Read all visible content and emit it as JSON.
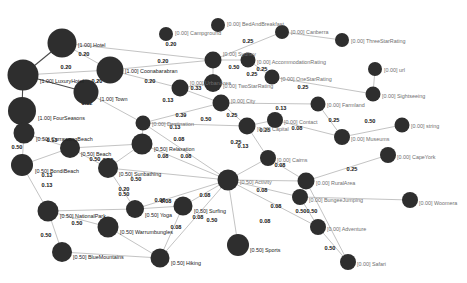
{
  "figure": {
    "type": "network-graph",
    "title": "",
    "background_color": "#ffffff",
    "node_color": "#2e2e2e",
    "edge_color": "#9a9a9a",
    "edge_color_strong": "#4a4a4a",
    "label_color_dim": "#6f6f6f",
    "label_color_strong": "#202020",
    "edge_label_color": "#141414"
  },
  "chart_data": {
    "type": "scatter",
    "title": "",
    "xlabel": "",
    "ylabel": "",
    "nodes": [
      {
        "id": "Hotel",
        "label": "[1.00] Hotel",
        "score": 1.0,
        "x": 62,
        "y": 43,
        "r": 14.5,
        "label_dx": 16,
        "label_dy": 3,
        "strong": true
      },
      {
        "id": "LuxuryHotel",
        "label": "[1.00] LuxuryHotel",
        "score": 1.0,
        "x": 23,
        "y": 75,
        "r": 15.5,
        "label_dx": 17,
        "label_dy": 7,
        "strong": true
      },
      {
        "id": "FourSeasons",
        "label": "[1.00] FourSeasons",
        "score": 1.0,
        "x": 22,
        "y": 111,
        "r": 14.0,
        "label_dx": 16,
        "label_dy": 8,
        "strong": true
      },
      {
        "id": "Town",
        "label": "[1.00] Town",
        "score": 1.0,
        "x": 86,
        "y": 92,
        "r": 12.5,
        "label_dx": 14,
        "label_dy": 8,
        "strong": true
      },
      {
        "id": "Coonabarabran",
        "label": "[1.00] Coonabarabran",
        "score": 1.0,
        "x": 110,
        "y": 70,
        "r": 13.5,
        "label_dx": 15,
        "label_dy": 2,
        "strong": true
      },
      {
        "id": "CurrawongBeach",
        "label": "[0.50] CurrawongBeach",
        "score": 0.5,
        "x": 24,
        "y": 133,
        "r": 10.5,
        "label_dx": 12,
        "label_dy": 7,
        "strong": true
      },
      {
        "id": "BondiBeach",
        "label": "[0.50] BondiBeach",
        "score": 0.5,
        "x": 22,
        "y": 165,
        "r": 11.0,
        "label_dx": 13,
        "label_dy": 7,
        "strong": true
      },
      {
        "id": "Beach",
        "label": "[0.50] Beach",
        "score": 0.5,
        "x": 70,
        "y": 148,
        "r": 10.0,
        "label_dx": 11,
        "label_dy": 7,
        "strong": true
      },
      {
        "id": "Sunbathing",
        "label": "[0.50] Sunbathing",
        "score": 0.5,
        "x": 108,
        "y": 168,
        "r": 10.0,
        "label_dx": 11,
        "label_dy": 7,
        "strong": true
      },
      {
        "id": "NationalPark",
        "label": "[0.50] NationalPark",
        "score": 0.5,
        "x": 48,
        "y": 211,
        "r": 10.5,
        "label_dx": 12,
        "label_dy": 6,
        "strong": true
      },
      {
        "id": "BlueMountains",
        "label": "[0.50] BlueMountains",
        "score": 0.5,
        "x": 62,
        "y": 252,
        "r": 10.0,
        "label_dx": 11,
        "label_dy": 6,
        "strong": true
      },
      {
        "id": "Warrumbungles",
        "label": "[0.50] Warrumbungles",
        "score": 0.5,
        "x": 108,
        "y": 227,
        "r": 10.5,
        "label_dx": 12,
        "label_dy": 6,
        "strong": true
      },
      {
        "id": "Yoga",
        "label": "[0.50] Yoga",
        "score": 0.5,
        "x": 135,
        "y": 209,
        "r": 9.0,
        "label_dx": 10,
        "label_dy": 7,
        "strong": true
      },
      {
        "id": "Hiking",
        "label": "[0.50] Hiking",
        "score": 0.5,
        "x": 160,
        "y": 258,
        "r": 9.5,
        "label_dx": 11,
        "label_dy": 6,
        "strong": true
      },
      {
        "id": "Surfing",
        "label": "[0.50] Surfing",
        "score": 0.5,
        "x": 183,
        "y": 206,
        "r": 9.5,
        "label_dx": 11,
        "label_dy": 6,
        "strong": true
      },
      {
        "id": "Sports",
        "label": "[0.50] Sports",
        "score": 0.5,
        "x": 238,
        "y": 245,
        "r": 11.0,
        "label_dx": 12,
        "label_dy": 6,
        "strong": true
      },
      {
        "id": "Relaxation",
        "label": "[0.50] Relaxation",
        "score": 0.5,
        "x": 142,
        "y": 144,
        "r": 10.5,
        "label_dx": 12,
        "label_dy": 6,
        "strong": true
      },
      {
        "id": "Activity",
        "label": "[0.50] Activity",
        "score": 0.5,
        "x": 228,
        "y": 180,
        "r": 10.5,
        "label_dx": 12,
        "label_dy": 3,
        "strong": false
      },
      {
        "id": "Destination",
        "label": "[0.00] Destination",
        "score": 0.0,
        "x": 143,
        "y": 123,
        "r": 7.5,
        "label_dx": 9,
        "label_dy": 2,
        "strong": false
      },
      {
        "id": "Campground",
        "label": "[0.00] Campground",
        "score": 0.0,
        "x": 166,
        "y": 34,
        "r": 7.0,
        "label_dx": 9,
        "label_dy": 0,
        "strong": false
      },
      {
        "id": "BedAndBreakfast",
        "label": "[0.00] BedAndBreakfast",
        "score": 0.0,
        "x": 218,
        "y": 25,
        "r": 7.0,
        "label_dx": 9,
        "label_dy": 0,
        "strong": false
      },
      {
        "id": "Sydney",
        "label": "[0.00] Sydney",
        "score": 0.0,
        "x": 213,
        "y": 60,
        "r": 8.5,
        "label_dx": 10,
        "label_dy": -5,
        "strong": false
      },
      {
        "id": "AccommodationRating",
        "label": "[0.00] AccommodationRating",
        "score": 0.0,
        "x": 248,
        "y": 60,
        "r": 7.5,
        "label_dx": 9,
        "label_dy": 3,
        "strong": false
      },
      {
        "id": "Canberra",
        "label": "[0.00] Canberra",
        "score": 0.0,
        "x": 282,
        "y": 32,
        "r": 7.0,
        "label_dx": 9,
        "label_dy": 1,
        "strong": false
      },
      {
        "id": "ThreeStarRating",
        "label": "[0.00] ThreeStarRating",
        "score": 0.0,
        "x": 342,
        "y": 40,
        "r": 7.0,
        "label_dx": 9,
        "label_dy": 2,
        "strong": false
      },
      {
        "id": "OneStarRating",
        "label": "[0.00] OneStarRating",
        "score": 0.0,
        "x": 272,
        "y": 77,
        "r": 7.5,
        "label_dx": 9,
        "label_dy": 3,
        "strong": false
      },
      {
        "id": "TwoStarRating",
        "label": "[0.00] TwoStarRating",
        "score": 0.0,
        "x": 213,
        "y": 83,
        "r": 9.0,
        "label_dx": 10,
        "label_dy": 4,
        "strong": false
      },
      {
        "id": "UrbanArea",
        "label": "[0.00] UrbanArea",
        "score": 0.0,
        "x": 180,
        "y": 88,
        "r": 8.5,
        "label_dx": 10,
        "label_dy": -4,
        "strong": false
      },
      {
        "id": "City",
        "label": "[0.00] City",
        "score": 0.0,
        "x": 221,
        "y": 103,
        "r": 8.5,
        "label_dx": 10,
        "label_dy": -1,
        "strong": false
      },
      {
        "id": "url",
        "label": "[0.00] url",
        "score": 0.0,
        "x": 375,
        "y": 69,
        "r": 7.0,
        "label_dx": 9,
        "label_dy": 2,
        "strong": false
      },
      {
        "id": "Sightseeing",
        "label": "[0.00] Sightseeing",
        "score": 0.0,
        "x": 373,
        "y": 94,
        "r": 7.5,
        "label_dx": 9,
        "label_dy": 3,
        "strong": false
      },
      {
        "id": "Farmland",
        "label": "[0.00] Farmland",
        "score": 0.0,
        "x": 318,
        "y": 104,
        "r": 7.5,
        "label_dx": 9,
        "label_dy": 2,
        "strong": false
      },
      {
        "id": "Capital",
        "label": "[0.00] Capital",
        "score": 0.0,
        "x": 247,
        "y": 126,
        "r": 8.5,
        "label_dx": 10,
        "label_dy": 4,
        "strong": false
      },
      {
        "id": "Contact",
        "label": "[0.00] Contact",
        "score": 0.0,
        "x": 275,
        "y": 120,
        "r": 8.0,
        "label_dx": 9,
        "label_dy": 3,
        "strong": false
      },
      {
        "id": "Museums",
        "label": "[0.00] Museums",
        "score": 0.0,
        "x": 342,
        "y": 137,
        "r": 8.0,
        "label_dx": 9,
        "label_dy": 3,
        "strong": false
      },
      {
        "id": "string",
        "label": "[0.00] string",
        "score": 0.0,
        "x": 402,
        "y": 125,
        "r": 7.5,
        "label_dx": 9,
        "label_dy": 2,
        "strong": false
      },
      {
        "id": "CapeYork",
        "label": "[0.00] CapeYork",
        "score": 0.0,
        "x": 388,
        "y": 155,
        "r": 8.0,
        "label_dx": 9,
        "label_dy": 3,
        "strong": false
      },
      {
        "id": "Cairns",
        "label": "[0.00] Cairns",
        "score": 0.0,
        "x": 268,
        "y": 158,
        "r": 8.0,
        "label_dx": 9,
        "label_dy": 3,
        "strong": false
      },
      {
        "id": "RuralArea",
        "label": "[0.00] RuralArea",
        "score": 0.0,
        "x": 306,
        "y": 181,
        "r": 8.5,
        "label_dx": 10,
        "label_dy": 3,
        "strong": false
      },
      {
        "id": "BungeeJumping",
        "label": "[0.00] BungeeJumping",
        "score": 0.0,
        "x": 300,
        "y": 197,
        "r": 8.0,
        "label_dx": 9,
        "label_dy": 4,
        "strong": false
      },
      {
        "id": "Woomera",
        "label": "[0.00] Woomera",
        "score": 0.0,
        "x": 410,
        "y": 200,
        "r": 8.0,
        "label_dx": 9,
        "label_dy": 4,
        "strong": false
      },
      {
        "id": "Adventure",
        "label": "[0.00] Adventure",
        "score": 0.0,
        "x": 318,
        "y": 227,
        "r": 8.0,
        "label_dx": 9,
        "label_dy": 3,
        "strong": false
      },
      {
        "id": "Safari",
        "label": "[0.00] Safari",
        "score": 0.0,
        "x": 348,
        "y": 262,
        "r": 8.0,
        "label_dx": 9,
        "label_dy": 3,
        "strong": false
      }
    ],
    "edges": [
      {
        "source": "Hotel",
        "target": "LuxuryHotel",
        "weight": null,
        "dark": true
      },
      {
        "source": "LuxuryHotel",
        "target": "FourSeasons",
        "weight": null,
        "dark": true
      },
      {
        "source": "LuxuryHotel",
        "target": "Town",
        "weight": null,
        "dark": true
      },
      {
        "source": "Hotel",
        "target": "Coonabarabran",
        "weight": "0.20",
        "lx": 84,
        "ly": 55
      },
      {
        "source": "Hotel",
        "target": "Sydney",
        "weight": "0.20",
        "lx": 171,
        "ly": 45
      },
      {
        "source": "Coonabarabran",
        "target": "Town",
        "weight": "0.20",
        "lx": 97,
        "ly": 82
      },
      {
        "source": "Town",
        "target": "Destination",
        "weight": "0.12",
        "lx": 87,
        "ly": 104
      },
      {
        "source": "LuxuryHotel",
        "target": "Coonabarabran",
        "weight": "0.20",
        "lx": 66,
        "ly": 68
      },
      {
        "source": "Coonabarabran",
        "target": "UrbanArea",
        "weight": "0.20",
        "lx": 150,
        "ly": 82
      },
      {
        "source": "Coonabarabran",
        "target": "Sydney",
        "weight": "0.20",
        "lx": 163,
        "ly": 62
      },
      {
        "source": "UrbanArea",
        "target": "City",
        "weight": "0.33",
        "lx": 196,
        "ly": 89
      },
      {
        "source": "UrbanArea",
        "target": "TwoStarRating",
        "weight": "0.13",
        "lx": 168,
        "ly": 101
      },
      {
        "source": "Sydney",
        "target": "AccommodationRating",
        "weight": "0.50",
        "lx": 234,
        "ly": 68
      },
      {
        "source": "Sydney",
        "target": "TwoStarRating",
        "weight": "0.25",
        "lx": 252,
        "ly": 75
      },
      {
        "source": "Sydney",
        "target": "Canberra",
        "weight": "0.25",
        "lx": 248,
        "ly": 42
      },
      {
        "source": "Canberra",
        "target": "ThreeStarRating",
        "weight": null
      },
      {
        "source": "AccommodationRating",
        "target": "OneStarRating",
        "weight": "0.25",
        "lx": 262,
        "ly": 70
      },
      {
        "source": "OneStarRating",
        "target": "Sightseeing",
        "weight": "0.25",
        "lx": 303,
        "ly": 88
      },
      {
        "source": "Sightseeing",
        "target": "url",
        "weight": null
      },
      {
        "source": "City",
        "target": "Capital",
        "weight": "0.25",
        "lx": 232,
        "ly": 116
      },
      {
        "source": "City",
        "target": "Farmland",
        "weight": "0.13",
        "lx": 281,
        "ly": 109
      },
      {
        "source": "Destination",
        "target": "Capital",
        "weight": "0.50",
        "lx": 206,
        "ly": 120
      },
      {
        "source": "Destination",
        "target": "Relaxation",
        "weight": "0.13",
        "lx": 175,
        "ly": 128
      },
      {
        "source": "Destination",
        "target": "City",
        "weight": "0.39",
        "lx": 181,
        "ly": 116
      },
      {
        "source": "Destination",
        "target": "Activity",
        "weight": "0.08",
        "lx": 179,
        "ly": 140
      },
      {
        "source": "Capital",
        "target": "Cairns",
        "weight": "0.25",
        "lx": 236,
        "ly": 143
      },
      {
        "source": "Capital",
        "target": "Contact",
        "weight": "0.25",
        "lx": 265,
        "ly": 131
      },
      {
        "source": "Contact",
        "target": "Museums",
        "weight": "0.08",
        "lx": 297,
        "ly": 129
      },
      {
        "source": "Farmland",
        "target": "Museums",
        "weight": "0.25",
        "lx": 334,
        "ly": 121
      },
      {
        "source": "Museums",
        "target": "string",
        "weight": "0.50",
        "lx": 370,
        "ly": 122
      },
      {
        "source": "Cairns",
        "target": "Activity",
        "weight": "0.13",
        "lx": 243,
        "ly": 147
      },
      {
        "source": "Cairns",
        "target": "RuralArea",
        "weight": "0.08",
        "lx": 280,
        "ly": 166
      },
      {
        "source": "RuralArea",
        "target": "CapeYork",
        "weight": "0.25",
        "lx": 352,
        "ly": 170
      },
      {
        "source": "Activity",
        "target": "RuralArea",
        "weight": null
      },
      {
        "source": "Activity",
        "target": "BungeeJumping",
        "weight": "0.08",
        "lx": 262,
        "ly": 191
      },
      {
        "source": "Activity",
        "target": "Adventure",
        "weight": "0.08",
        "lx": 276,
        "ly": 207
      },
      {
        "source": "Activity",
        "target": "Sports",
        "weight": "0.08",
        "lx": 265,
        "ly": 222
      },
      {
        "source": "Activity",
        "target": "Surfing",
        "weight": "0.08",
        "lx": 205,
        "ly": 196
      },
      {
        "source": "Activity",
        "target": "Hiking",
        "weight": "0.08",
        "lx": 198,
        "ly": 218
      },
      {
        "source": "Activity",
        "target": "Relaxation",
        "weight": "0.08",
        "lx": 186,
        "ly": 157
      },
      {
        "source": "Activity",
        "target": "Sunbathing",
        "weight": "0.50",
        "lx": 136,
        "ly": 180
      },
      {
        "source": "Activity",
        "target": "Yoga",
        "weight": "0.08",
        "lx": 166,
        "ly": 202
      },
      {
        "source": "BungeeJumping",
        "target": "Adventure",
        "weight": "0.50",
        "lx": 301,
        "ly": 212
      },
      {
        "source": "BungeeJumping",
        "target": "Woomera",
        "weight": null
      },
      {
        "source": "Adventure",
        "target": "Safari",
        "weight": "0.50",
        "lx": 330,
        "ly": 249
      },
      {
        "source": "RuralArea",
        "target": "Safari",
        "weight": "0.50",
        "lx": 312,
        "ly": 212
      },
      {
        "source": "Relaxation",
        "target": "Sunbathing",
        "weight": "0.08",
        "lx": 163,
        "ly": 157
      },
      {
        "source": "Relaxation",
        "target": "Beach",
        "weight": "0.50",
        "lx": 108,
        "ly": 161
      },
      {
        "source": "Beach",
        "target": "CurrawongBeach",
        "weight": "0.13",
        "lx": 52,
        "ly": 141
      },
      {
        "source": "Beach",
        "target": "BondiBeach",
        "weight": "0.13",
        "lx": 47,
        "ly": 176
      },
      {
        "source": "CurrawongBeach",
        "target": "BondiBeach",
        "weight": "0.50",
        "lx": 17,
        "ly": 148
      },
      {
        "source": "Beach",
        "target": "Sunbathing",
        "weight": "0.50",
        "lx": 95,
        "ly": 160
      },
      {
        "source": "NationalPark",
        "target": "BondiBeach",
        "weight": "0.13",
        "lx": 47,
        "ly": 186
      },
      {
        "source": "NationalPark",
        "target": "Warrumbungles",
        "weight": "0.50",
        "lx": 77,
        "ly": 224
      },
      {
        "source": "NationalPark",
        "target": "BlueMountains",
        "weight": "0.50",
        "lx": 46,
        "ly": 236
      },
      {
        "source": "NationalPark",
        "target": "Yoga",
        "weight": "0.50",
        "lx": 124,
        "ly": 195
      },
      {
        "source": "Yoga",
        "target": "Surfing",
        "weight": "0.08",
        "lx": 160,
        "ly": 201
      },
      {
        "source": "Warrumbungles",
        "target": "Hiking",
        "weight": "0.08",
        "lx": 176,
        "ly": 228
      },
      {
        "source": "Surfing",
        "target": "Hiking",
        "weight": "0.50",
        "lx": 212,
        "ly": 221
      },
      {
        "source": "BlueMountains",
        "target": "Hiking",
        "weight": null
      },
      {
        "source": "Sunbathing",
        "target": "Yoga",
        "weight": "0.20",
        "lx": 124,
        "ly": 190
      }
    ]
  }
}
